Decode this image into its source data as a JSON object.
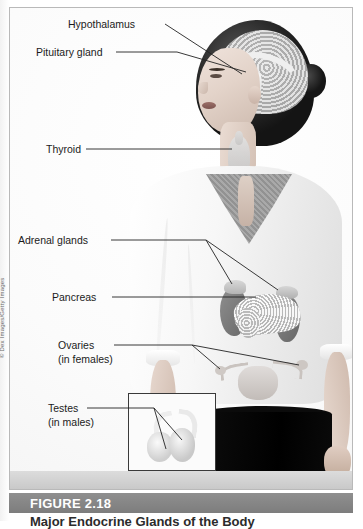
{
  "figure": {
    "number_label": "FIGURE 2.18",
    "caption": "Major Endocrine Glands of the Body",
    "credit": "© Dex Images/Getty Images"
  },
  "labels": [
    {
      "id": "hypothalamus",
      "line1": "Hypothalamus",
      "line2": ""
    },
    {
      "id": "pituitary",
      "line1": "Pituitary gland",
      "line2": ""
    },
    {
      "id": "thyroid",
      "line1": "Thyroid",
      "line2": ""
    },
    {
      "id": "adrenal-glands",
      "line1": "Adrenal glands",
      "line2": ""
    },
    {
      "id": "pancreas",
      "line1": "Pancreas",
      "line2": ""
    },
    {
      "id": "ovaries",
      "line1": "Ovaries",
      "line2": "(in females)"
    },
    {
      "id": "testes",
      "line1": "Testes",
      "line2": "(in males)"
    }
  ],
  "colors": {
    "banner": "#7d7d7d",
    "banner_text": "#ffffff",
    "label_text": "#1b1b1b",
    "frame_border": "#b9b9b9",
    "leader_line": "#222222",
    "skirt": "#000000"
  }
}
